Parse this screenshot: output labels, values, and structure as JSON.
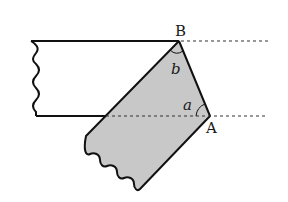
{
  "diagram": {
    "type": "geometry-folded-strip",
    "labels": {
      "point_b": "B",
      "point_a": "A",
      "angle_b": "b",
      "angle_a": "a"
    },
    "colors": {
      "stroke": "#111111",
      "fill_folded": "#c8c8c8",
      "dashed": "#333333",
      "background": "#ffffff"
    }
  }
}
